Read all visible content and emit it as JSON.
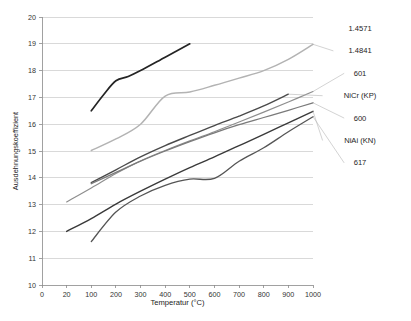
{
  "chart_data": {
    "type": "line",
    "title": "",
    "xlabel": "Temperatur (°C)",
    "ylabel": "Ausdehnungskoeffizient",
    "x_tick_labels": [
      "0",
      "20",
      "100",
      "200",
      "300",
      "400",
      "500",
      "600",
      "700",
      "800",
      "900",
      "1000"
    ],
    "x_axis_kind": "category",
    "y_tick_labels": [
      "10",
      "11",
      "12",
      "13",
      "14",
      "15",
      "16",
      "17",
      "18",
      "19",
      "20"
    ],
    "ylim": [
      10,
      20
    ],
    "grid": "horizontal",
    "legend_position": "right-outside",
    "series": [
      {
        "name": "1.4571",
        "color": "#6f6f6f",
        "width": 1.1,
        "label_only": true,
        "points": []
      },
      {
        "name": "1.4841",
        "color": "#b3b3b3",
        "width": 1.5,
        "points": [
          {
            "x": "100",
            "y": 15.02
          },
          {
            "x": "200",
            "y": 15.45
          },
          {
            "x": "300",
            "y": 16.0
          },
          {
            "x": "400",
            "y": 17.05
          },
          {
            "x": "500",
            "y": 17.2
          },
          {
            "x": "600",
            "y": 17.45
          },
          {
            "x": "700",
            "y": 17.72
          },
          {
            "x": "800",
            "y": 18.0
          },
          {
            "x": "900",
            "y": 18.42
          },
          {
            "x": "1000",
            "y": 18.98
          }
        ]
      },
      {
        "name": "601",
        "color": "#8e8e8e",
        "width": 1.2,
        "points": [
          {
            "x": "20",
            "y": 13.1
          },
          {
            "x": "100",
            "y": 13.62
          },
          {
            "x": "200",
            "y": 14.16
          },
          {
            "x": "300",
            "y": 14.63
          },
          {
            "x": "400",
            "y": 15.02
          },
          {
            "x": "500",
            "y": 15.38
          },
          {
            "x": "600",
            "y": 15.72
          },
          {
            "x": "700",
            "y": 16.08
          },
          {
            "x": "800",
            "y": 16.45
          },
          {
            "x": "900",
            "y": 16.83
          },
          {
            "x": "1000",
            "y": 17.22
          }
        ]
      },
      {
        "name": "NiCr (KP)",
        "color": "#4a4a4a",
        "width": 1.4,
        "points": [
          {
            "x": "100",
            "y": 13.82
          },
          {
            "x": "200",
            "y": 14.3
          },
          {
            "x": "300",
            "y": 14.78
          },
          {
            "x": "400",
            "y": 15.2
          },
          {
            "x": "500",
            "y": 15.58
          },
          {
            "x": "600",
            "y": 15.95
          },
          {
            "x": "700",
            "y": 16.3
          },
          {
            "x": "800",
            "y": 16.68
          },
          {
            "x": "900",
            "y": 17.12
          }
        ]
      },
      {
        "name": "600",
        "color": "#7a7a7a",
        "width": 1.3,
        "points": [
          {
            "x": "100",
            "y": 13.78
          },
          {
            "x": "200",
            "y": 14.2
          },
          {
            "x": "300",
            "y": 14.62
          },
          {
            "x": "400",
            "y": 15.0
          },
          {
            "x": "500",
            "y": 15.35
          },
          {
            "x": "600",
            "y": 15.68
          },
          {
            "x": "700",
            "y": 15.98
          },
          {
            "x": "800",
            "y": 16.25
          },
          {
            "x": "900",
            "y": 16.52
          },
          {
            "x": "1000",
            "y": 16.8
          }
        ]
      },
      {
        "name": "NiAi (KN)",
        "color": "#3a3a3a",
        "width": 1.4,
        "points": [
          {
            "x": "20",
            "y": 12.0
          },
          {
            "x": "100",
            "y": 12.48
          },
          {
            "x": "200",
            "y": 13.02
          },
          {
            "x": "300",
            "y": 13.5
          },
          {
            "x": "400",
            "y": 13.95
          },
          {
            "x": "500",
            "y": 14.38
          },
          {
            "x": "600",
            "y": 14.78
          },
          {
            "x": "700",
            "y": 15.2
          },
          {
            "x": "800",
            "y": 15.62
          },
          {
            "x": "900",
            "y": 16.05
          },
          {
            "x": "1000",
            "y": 16.48
          }
        ]
      },
      {
        "name": "617",
        "color": "#555555",
        "width": 1.3,
        "points": [
          {
            "x": "100",
            "y": 11.62
          },
          {
            "x": "200",
            "y": 12.72
          },
          {
            "x": "300",
            "y": 13.32
          },
          {
            "x": "400",
            "y": 13.72
          },
          {
            "x": "500",
            "y": 13.95
          },
          {
            "x": "600",
            "y": 13.98
          },
          {
            "x": "700",
            "y": 14.62
          },
          {
            "x": "800",
            "y": 15.12
          },
          {
            "x": "900",
            "y": 15.72
          },
          {
            "x": "1000",
            "y": 16.28
          }
        ]
      },
      {
        "name": "617-top",
        "color": "#242424",
        "width": 1.7,
        "hidden_legend": true,
        "points": [
          {
            "x": "100",
            "y": 16.5
          },
          {
            "x": "150",
            "y": 17.1
          },
          {
            "x": "200",
            "y": 17.62
          },
          {
            "x": "250",
            "y": 17.78
          },
          {
            "x": "300",
            "y": 18.0
          },
          {
            "x": "400",
            "y": 18.5
          },
          {
            "x": "500",
            "y": 19.0
          }
        ]
      }
    ],
    "legend_entries": [
      {
        "label": "1.4571"
      },
      {
        "label": "1.4841"
      },
      {
        "label": "601"
      },
      {
        "label": "NiCr (KP)"
      },
      {
        "label": "600"
      },
      {
        "label": "NiAi (KN)"
      },
      {
        "label": "617"
      }
    ]
  }
}
